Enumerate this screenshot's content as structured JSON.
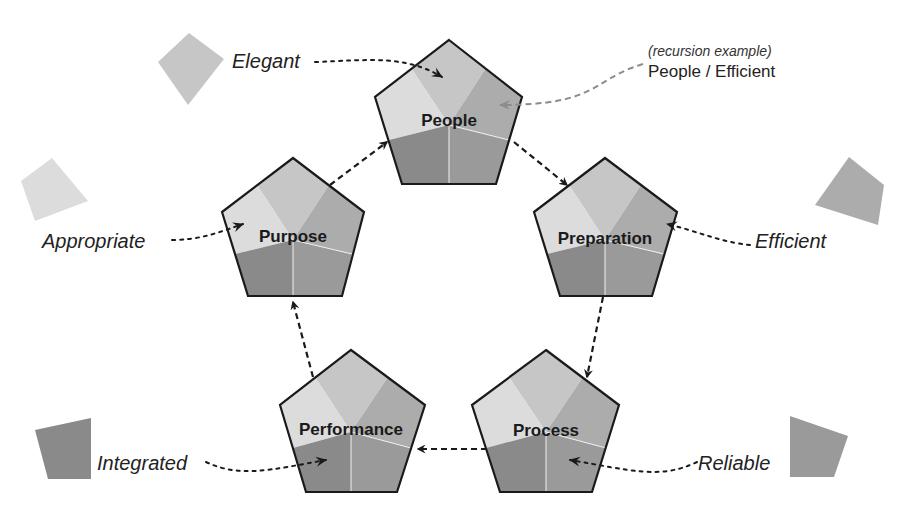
{
  "diagram": {
    "type": "cycle",
    "nodes": [
      {
        "id": "people",
        "label": "People",
        "cx": 449,
        "cy": 125
      },
      {
        "id": "preparation",
        "label": "Preparation",
        "cx": 605,
        "cy": 240
      },
      {
        "id": "process",
        "label": "Process",
        "cx": 546,
        "cy": 432
      },
      {
        "id": "performance",
        "label": "Performance",
        "cx": 351,
        "cy": 432
      },
      {
        "id": "purpose",
        "label": "Purpose",
        "cx": 293,
        "cy": 240
      }
    ],
    "cycle_edges": [
      {
        "from": "people",
        "to": "preparation"
      },
      {
        "from": "preparation",
        "to": "process"
      },
      {
        "from": "process",
        "to": "performance"
      },
      {
        "from": "performance",
        "to": "purpose"
      },
      {
        "from": "purpose",
        "to": "people"
      }
    ],
    "qualities": [
      {
        "id": "elegant",
        "label": "Elegant",
        "target": "people",
        "shade": "#c6c6c6"
      },
      {
        "id": "efficient",
        "label": "Efficient",
        "target": "preparation",
        "shade": "#acacac"
      },
      {
        "id": "reliable",
        "label": "Reliable",
        "target": "process",
        "shade": "#9a9a9a"
      },
      {
        "id": "integrated",
        "label": "Integrated",
        "target": "performance",
        "shade": "#8a8a8a"
      },
      {
        "id": "appropriate",
        "label": "Appropriate",
        "target": "purpose",
        "shade": "#dcdcdc"
      }
    ],
    "recursion_note": {
      "caption": "(recursion example)",
      "label": "People / Efficient",
      "target": "people",
      "arrow_color": "#8c8c8c"
    },
    "colors": {
      "outline": "#1a1a1a",
      "segment_top": "#c6c6c6",
      "segment_upper_left": "#dcdcdc",
      "segment_upper_right": "#acacac",
      "segment_lower_left": "#8a8a8a",
      "segment_lower_right": "#9a9a9a"
    }
  }
}
